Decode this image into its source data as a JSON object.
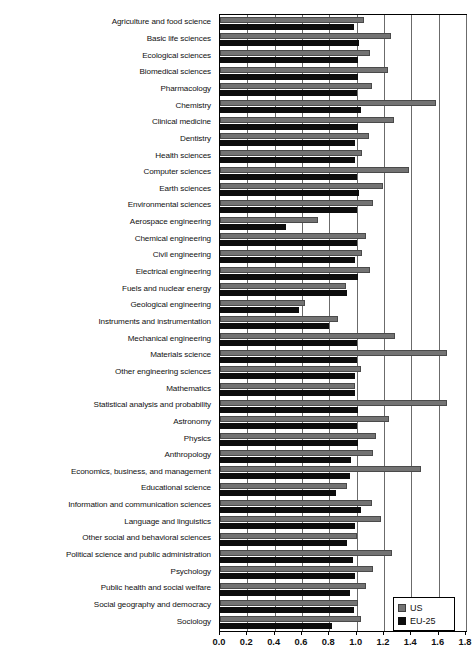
{
  "chart_data": {
    "type": "bar",
    "orientation": "horizontal",
    "title": "",
    "xlabel": "",
    "ylabel": "",
    "xlim": [
      0.0,
      1.8
    ],
    "xticks": [
      "0.0",
      "0.2",
      "0.4",
      "0.6",
      "0.8",
      "1.0",
      "1.2",
      "1.4",
      "1.6",
      "1.8"
    ],
    "grid": true,
    "legend_position": "bottom-right",
    "categories": [
      "Agriculture and food science",
      "Basic life sciences",
      "Ecological sciences",
      "Biomedical sciences",
      "Pharmacology",
      "Chemistry",
      "Clinical medicine",
      "Dentistry",
      "Health sciences",
      "Computer sciences",
      "Earth sciences",
      "Environmental sciences",
      "Aerospace engineering",
      "Chemical engineering",
      "Civil engineering",
      "Electrical engineering",
      "Fuels and nuclear energy",
      "Geological engineering",
      "Instruments and instrumentation",
      "Mechanical engineering",
      "Materials science",
      "Other engineering sciences",
      "Mathematics",
      "Statistical analysis and probability",
      "Astronomy",
      "Physics",
      "Anthropology",
      "Economics, business, and management",
      "Educational science",
      "Information and communication sciences",
      "Language and linguistics",
      "Other social and behavioral sciences",
      "Political science and public administration",
      "Psychology",
      "Public health and social welfare",
      "Social geography and democracy",
      "Sociology"
    ],
    "series": [
      {
        "name": "US",
        "color": "#737373",
        "values": [
          1.05,
          1.25,
          1.1,
          1.23,
          1.11,
          1.58,
          1.27,
          1.09,
          1.04,
          1.38,
          1.19,
          1.12,
          0.72,
          1.07,
          1.04,
          1.1,
          0.92,
          0.62,
          0.86,
          1.28,
          1.66,
          1.03,
          0.99,
          1.66,
          1.24,
          1.14,
          1.12,
          1.47,
          0.93,
          1.11,
          1.18,
          1.0,
          1.26,
          1.12,
          1.07,
          1.01,
          1.03
        ]
      },
      {
        "name": "EU-25",
        "color": "#0d0d0d",
        "values": [
          0.98,
          1.02,
          1.01,
          1.01,
          1.0,
          1.03,
          1.01,
          0.99,
          0.99,
          1.0,
          1.02,
          1.0,
          0.48,
          1.0,
          0.99,
          1.01,
          0.93,
          0.58,
          0.8,
          1.0,
          1.0,
          0.99,
          0.99,
          1.01,
          1.0,
          1.01,
          0.96,
          0.95,
          0.85,
          1.03,
          0.99,
          0.93,
          0.97,
          0.99,
          0.95,
          0.98,
          0.82
        ]
      }
    ]
  },
  "legend": {
    "items": [
      {
        "label": "US",
        "swatch": "us"
      },
      {
        "label": "EU-25",
        "swatch": "eu"
      }
    ]
  }
}
